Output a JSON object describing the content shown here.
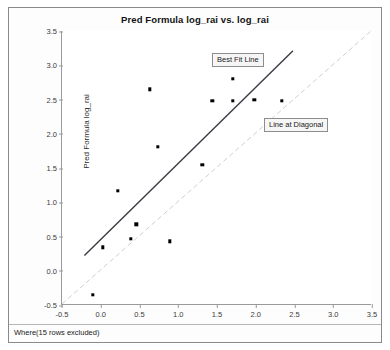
{
  "window": {
    "footer_note": "Where(15 rows excluded)"
  },
  "chart_data": {
    "type": "scatter",
    "title": "Pred Formula log_rai vs. log_rai",
    "xlabel": "log_rai",
    "ylabel": "Pred Formula log_rai",
    "xlim": [
      -0.5,
      3.5
    ],
    "ylim": [
      -0.5,
      3.5
    ],
    "xticks": [
      "-0.5",
      "0.0",
      "0.5",
      "1.0",
      "1.5",
      "2.0",
      "2.5",
      "3.0",
      "3.5"
    ],
    "yticks": [
      "-0.5",
      "0.0",
      "0.5",
      "1.0",
      "1.5",
      "2.0",
      "2.5",
      "3.0",
      "3.5"
    ],
    "xtick_values": [
      -0.5,
      0.0,
      0.5,
      1.0,
      1.5,
      2.0,
      2.5,
      3.0,
      3.5
    ],
    "ytick_values": [
      -0.5,
      0.0,
      0.5,
      1.0,
      1.5,
      2.0,
      2.5,
      3.0,
      3.5
    ],
    "grid": false,
    "legend": "none",
    "point_color": "#000000",
    "points": [
      {
        "x": -0.1,
        "y": -0.35
      },
      {
        "x": 0.03,
        "y": 0.34
      },
      {
        "x": 0.22,
        "y": 1.17
      },
      {
        "x": 0.39,
        "y": 0.47
      },
      {
        "x": 0.46,
        "y": 0.68
      },
      {
        "x": 0.63,
        "y": 2.65
      },
      {
        "x": 0.74,
        "y": 1.81
      },
      {
        "x": 0.89,
        "y": 0.43
      },
      {
        "x": 1.31,
        "y": 1.55
      },
      {
        "x": 1.44,
        "y": 2.48
      },
      {
        "x": 1.7,
        "y": 2.8
      },
      {
        "x": 1.7,
        "y": 2.48
      },
      {
        "x": 1.98,
        "y": 2.5
      },
      {
        "x": 2.34,
        "y": 2.48
      }
    ],
    "lines": [
      {
        "name": "Best Fit Line",
        "label": "Best Fit Line",
        "color": "#3a3a44",
        "style": "solid",
        "width": 1.4,
        "x0": -0.21,
        "y0": 0.21,
        "x1": 2.49,
        "y1": 3.21
      },
      {
        "name": "Line at Diagonal",
        "label": "Line at Diagonal",
        "color": "#cfcfcf",
        "style": "dashed",
        "width": 1,
        "x0": -0.5,
        "y0": -0.5,
        "x1": 3.5,
        "y1": 3.5
      }
    ],
    "annotations": [
      {
        "text": "Best Fit Line",
        "left_px": 203,
        "top_px": 45
      },
      {
        "text": "Line at Diagonal",
        "left_px": 255,
        "top_px": 110
      }
    ]
  }
}
